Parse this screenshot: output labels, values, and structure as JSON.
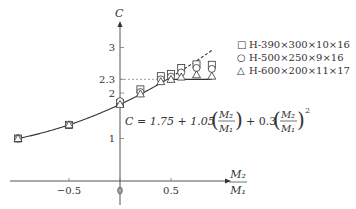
{
  "chart_data": {
    "type": "scatter",
    "title": "",
    "xlabel": "M2/M1",
    "ylabel": "C",
    "xlim": [
      -1.0,
      1.0
    ],
    "ylim": [
      0,
      3.5
    ],
    "x_ticks": [
      "-0.5",
      "0",
      "0.5"
    ],
    "y_ticks": [
      "1",
      "2",
      "2.3",
      "3"
    ],
    "grid": false,
    "legend_position": "right",
    "reference_line": {
      "label": "2.3",
      "value": 2.3,
      "style": "dashed"
    },
    "formula": {
      "text": "C = 1.75 + 1.05 (M2/M1) + 0.3 (M2/M1)^2",
      "coefficients": [
        1.75,
        1.05,
        0.3
      ],
      "cap": 2.3,
      "cap_style": "solid",
      "uncapped_style": "dashed"
    },
    "series": [
      {
        "name": "H-390×300×10×16",
        "marker": "square",
        "x": [
          -1.0,
          -0.5,
          0.0,
          0.2,
          0.4,
          0.5,
          0.6,
          0.75,
          0.9
        ],
        "y": [
          1.0,
          1.3,
          1.78,
          2.08,
          2.37,
          2.42,
          2.55,
          2.63,
          2.62
        ]
      },
      {
        "name": "H-500×250×9×16",
        "marker": "circle",
        "x": [
          -1.0,
          -0.5,
          0.0,
          0.2,
          0.4,
          0.5,
          0.6,
          0.75,
          0.9
        ],
        "y": [
          1.0,
          1.3,
          1.82,
          2.02,
          2.3,
          2.36,
          2.45,
          2.55,
          2.53
        ]
      },
      {
        "name": "H-600×200×11×17",
        "marker": "triangle",
        "x": [
          -1.0,
          -0.5,
          0.0,
          0.2,
          0.4,
          0.5,
          0.6,
          0.75,
          0.9
        ],
        "y": [
          1.0,
          1.3,
          1.75,
          1.98,
          2.25,
          2.3,
          2.35,
          2.4,
          2.37
        ]
      }
    ]
  },
  "legend": {
    "items": [
      {
        "symbol": "□",
        "label": "H-390×300×10×16"
      },
      {
        "symbol": "○",
        "label": "H-500×250×9×16"
      },
      {
        "symbol": "△",
        "label": "H-600×200×11×17"
      }
    ]
  },
  "labels": {
    "y_axis": "C",
    "x_axis_num": "M₂",
    "x_axis_den": "M₁",
    "formula_prefix": "C = 1.75 + 1.05",
    "formula_mid": "+ 0.3",
    "frac_num": "M₂",
    "frac_den": "M₁",
    "exponent": "2"
  }
}
